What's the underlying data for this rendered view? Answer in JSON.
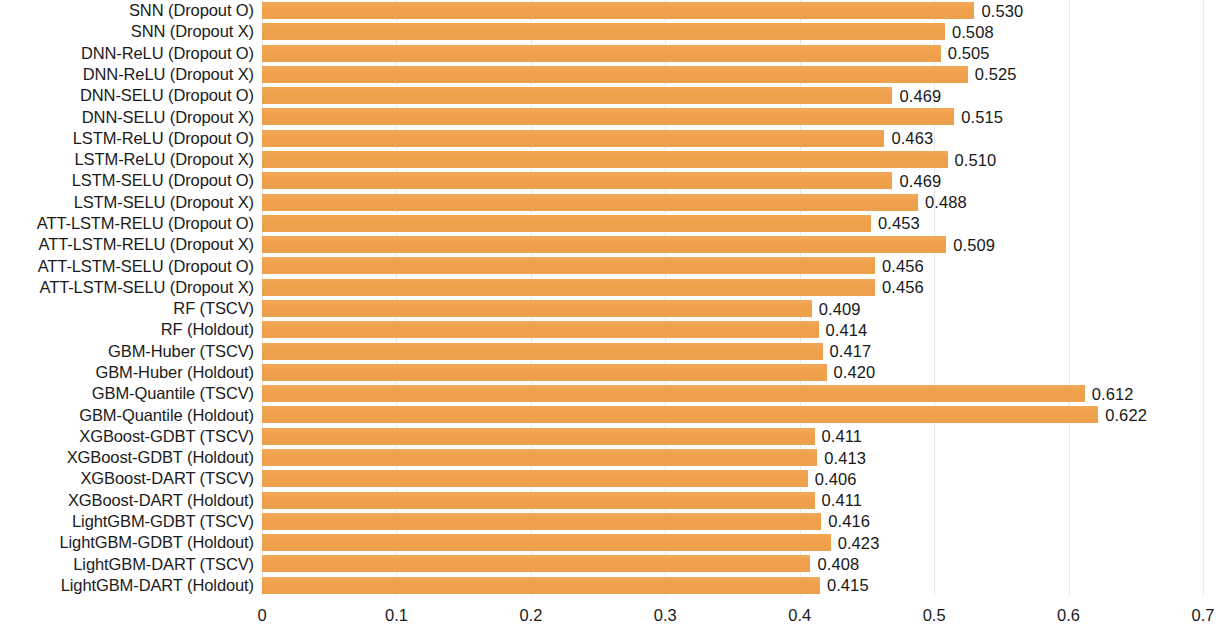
{
  "chart_data": {
    "type": "bar",
    "orientation": "horizontal",
    "title": "",
    "subtitle": "",
    "xlabel": "",
    "ylabel": "",
    "xlim": [
      0,
      0.7
    ],
    "xticks": [
      "0",
      "0.1",
      "0.2",
      "0.3",
      "0.4",
      "0.5",
      "0.6",
      "0.7"
    ],
    "xtick_values": [
      0,
      0.1,
      0.2,
      0.3,
      0.4,
      0.5,
      0.6,
      0.7
    ],
    "grid": true,
    "grid_axis": "x",
    "legend": null,
    "bar_color": "#f0a04b",
    "value_label_format": "0.000",
    "categories": [
      "SNN (Dropout O)",
      "SNN (Dropout X)",
      "DNN-ReLU (Dropout O)",
      "DNN-ReLU (Dropout X)",
      "DNN-SELU (Dropout O)",
      "DNN-SELU (Dropout X)",
      "LSTM-ReLU (Dropout O)",
      "LSTM-ReLU (Dropout X)",
      "LSTM-SELU (Dropout O)",
      "LSTM-SELU (Dropout X)",
      "ATT-LSTM-RELU (Dropout O)",
      "ATT-LSTM-RELU (Dropout X)",
      "ATT-LSTM-SELU (Dropout O)",
      "ATT-LSTM-SELU (Dropout X)",
      "RF (TSCV)",
      "RF (Holdout)",
      "GBM-Huber (TSCV)",
      "GBM-Huber (Holdout)",
      "GBM-Quantile (TSCV)",
      "GBM-Quantile (Holdout)",
      "XGBoost-GDBT (TSCV)",
      "XGBoost-GDBT (Holdout)",
      "XGBoost-DART (TSCV)",
      "XGBoost-DART (Holdout)",
      "LightGBM-GDBT (TSCV)",
      "LightGBM-GDBT (Holdout)",
      "LightGBM-DART (TSCV)",
      "LightGBM-DART (Holdout)"
    ],
    "values": [
      0.53,
      0.508,
      0.505,
      0.525,
      0.469,
      0.515,
      0.463,
      0.51,
      0.469,
      0.488,
      0.453,
      0.509,
      0.456,
      0.456,
      0.409,
      0.414,
      0.417,
      0.42,
      0.612,
      0.622,
      0.411,
      0.413,
      0.406,
      0.411,
      0.416,
      0.423,
      0.408,
      0.415
    ],
    "value_labels": [
      "0.530",
      "0.508",
      "0.505",
      "0.525",
      "0.469",
      "0.515",
      "0.463",
      "0.510",
      "0.469",
      "0.488",
      "0.453",
      "0.509",
      "0.456",
      "0.456",
      "0.409",
      "0.414",
      "0.417",
      "0.420",
      "0.612",
      "0.622",
      "0.411",
      "0.413",
      "0.406",
      "0.411",
      "0.416",
      "0.423",
      "0.408",
      "0.415"
    ]
  }
}
